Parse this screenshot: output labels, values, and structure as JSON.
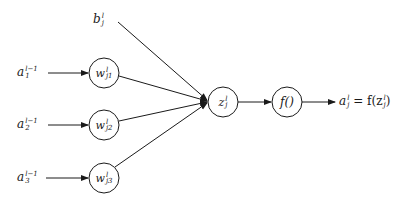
{
  "diagram": {
    "type": "neuron-computation",
    "inputs": [
      {
        "base": "a",
        "sub": "1",
        "sup": "l−1"
      },
      {
        "base": "a",
        "sub": "2",
        "sup": "l−1"
      },
      {
        "base": "a",
        "sub": "3",
        "sup": "l−1"
      }
    ],
    "weights": [
      {
        "base": "w",
        "sub": "j1",
        "sup": "l"
      },
      {
        "base": "w",
        "sub": "j2",
        "sup": "l"
      },
      {
        "base": "w",
        "sub": "j3",
        "sup": "l"
      }
    ],
    "bias": {
      "base": "b",
      "sub": "j",
      "sup": "l"
    },
    "sum_node": {
      "base": "z",
      "sub": "j",
      "sup": "l"
    },
    "activation_node": {
      "label": "f()"
    },
    "output": {
      "base": "a",
      "sub": "j",
      "sup": "l",
      "eq": " = f(z",
      "eq_sub": "j",
      "eq_sup": "l",
      "eq_end": ")"
    },
    "colors": {
      "stroke": "#1a1a1a",
      "background": "#ffffff"
    }
  }
}
